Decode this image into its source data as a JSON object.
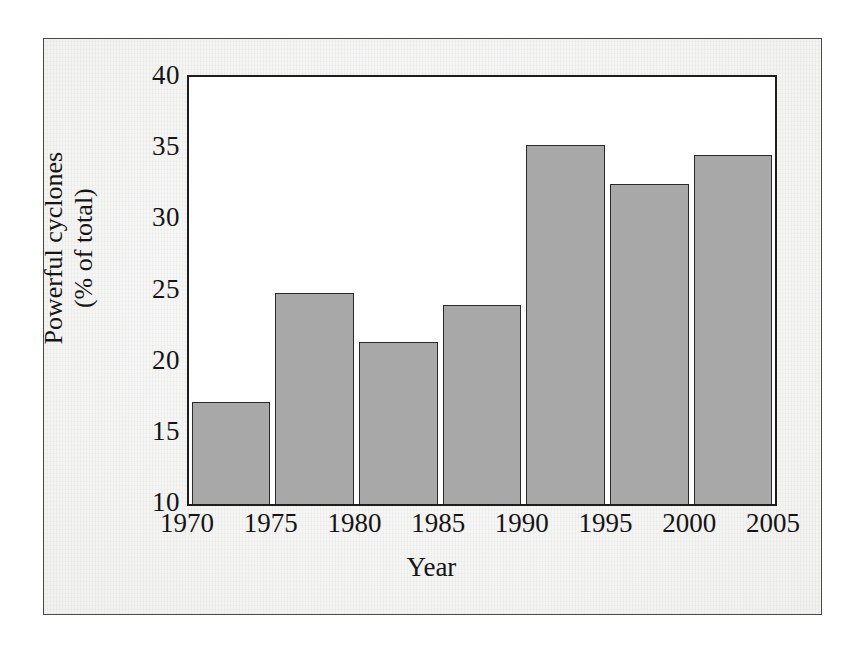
{
  "chart_data": {
    "type": "bar",
    "title": "",
    "xlabel": "Year",
    "ylabel_line1": "Powerful cyclones",
    "ylabel_line2": "(% of total)",
    "categories": [
      "1970",
      "1975",
      "1980",
      "1985",
      "1990",
      "1995",
      "2000"
    ],
    "x_tick_labels": [
      "1970",
      "1975",
      "1980",
      "1985",
      "1990",
      "1995",
      "2000",
      "2005"
    ],
    "values": [
      17.2,
      24.8,
      21.4,
      24.0,
      35.2,
      32.5,
      34.5
    ],
    "y_tick_labels": [
      "40",
      "35",
      "30",
      "25",
      "20",
      "15",
      "10"
    ],
    "y_ticks": [
      40,
      35,
      30,
      25,
      20,
      15,
      10
    ],
    "ylim": [
      10,
      40
    ],
    "grid": false,
    "legend": false,
    "bar_color": "#a8a8a8",
    "bar_edge_color": "#2a2a2a",
    "axis_color": "#1d1d1d",
    "background_color": "#ffffff"
  },
  "figure": {
    "frame_color": "#4a4a4a",
    "page_background": "#ffffff"
  }
}
